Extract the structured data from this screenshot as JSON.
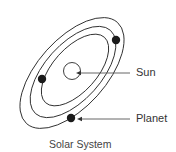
{
  "diagram": {
    "title": "Solar System",
    "labels": {
      "sun": "Sun",
      "planet": "Planet"
    },
    "colors": {
      "line": "#2a2a2a",
      "text": "#333333",
      "background": "#ffffff"
    },
    "orbit_count": 3,
    "planet_count": 3
  }
}
